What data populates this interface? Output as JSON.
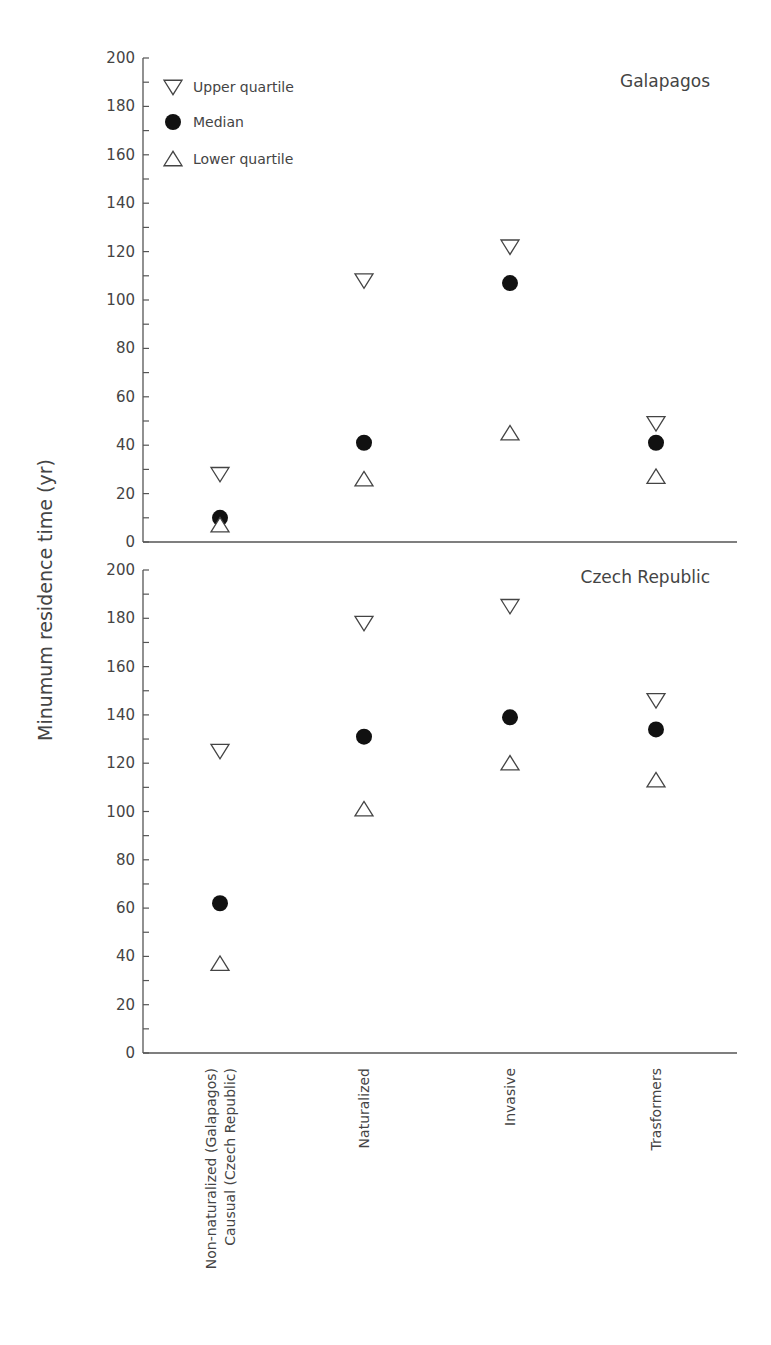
{
  "chart_data": {
    "type": "scatter",
    "ylabel": "Minumum residence time (yr)",
    "xlabel": "",
    "categories": [
      "Non-naturalized (Galapagos)\nCausual (Czech Republic)",
      "Naturalized",
      "Invasive",
      "Trasformers"
    ],
    "category_lines": [
      [
        "Non-naturalized (Galapagos)",
        "Causual (Czech Republic)"
      ],
      [
        "Naturalized"
      ],
      [
        "Invasive"
      ],
      [
        "Trasformers"
      ]
    ],
    "legend": [
      {
        "name": "Upper quartile",
        "marker": "triangle-down-open"
      },
      {
        "name": "Median",
        "marker": "circle-filled"
      },
      {
        "name": "Lower quartile",
        "marker": "triangle-up-open"
      }
    ],
    "legend_position": "upper-left of top panel",
    "grid": false,
    "panels": [
      {
        "title": "Galapagos",
        "ylim": [
          0,
          200
        ],
        "yticks": [
          0,
          20,
          40,
          60,
          80,
          100,
          120,
          140,
          160,
          180,
          200
        ],
        "series": [
          {
            "name": "Upper quartile",
            "values": [
              28,
              108,
              122,
              49
            ]
          },
          {
            "name": "Median",
            "values": [
              10,
              41,
              107,
              41
            ]
          },
          {
            "name": "Lower quartile",
            "values": [
              7,
              26,
              45,
              27
            ]
          }
        ]
      },
      {
        "title": "Czech Republic",
        "ylim": [
          0,
          200
        ],
        "yticks": [
          0,
          20,
          40,
          60,
          80,
          100,
          120,
          140,
          160,
          180,
          200
        ],
        "series": [
          {
            "name": "Upper quartile",
            "values": [
              125,
              178,
              185,
              146
            ]
          },
          {
            "name": "Median",
            "values": [
              62,
              131,
              139,
              134
            ]
          },
          {
            "name": "Lower quartile",
            "values": [
              37,
              101,
              120,
              113
            ]
          }
        ]
      }
    ]
  }
}
